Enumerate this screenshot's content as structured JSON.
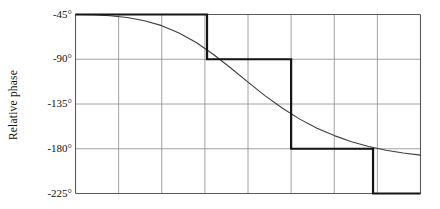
{
  "chart_data": {
    "type": "line",
    "title": "",
    "xlabel": "",
    "ylabel": "Relative phase",
    "ytick_labels": [
      "-45°",
      "-90°",
      "-135°",
      "-180°",
      "-225°"
    ],
    "ytick_values": [
      -45,
      -90,
      -135,
      -180,
      -225
    ],
    "ylim": [
      -225,
      -45
    ],
    "xlim": [
      0,
      8
    ],
    "xtick_labels": [],
    "grid": true,
    "legend": null,
    "series": [
      {
        "name": "smooth phase response",
        "style": "thin-curve",
        "x": [
          0.0,
          0.4,
          0.8,
          1.2,
          1.6,
          2.0,
          2.4,
          2.8,
          3.2,
          3.6,
          4.0,
          4.4,
          4.8,
          5.2,
          5.6,
          6.0,
          6.4,
          6.8,
          7.2,
          7.6,
          8.0
        ],
        "values": [
          -45.0,
          -45.3,
          -46.2,
          -48.0,
          -51.2,
          -56.2,
          -63.5,
          -73.2,
          -85.2,
          -98.8,
          -113.0,
          -126.8,
          -139.3,
          -150.2,
          -159.3,
          -166.8,
          -172.9,
          -177.7,
          -181.5,
          -184.3,
          -186.4
        ]
      },
      {
        "name": "stepwise approximation",
        "style": "thick-step",
        "step_x": [
          0.0,
          3.05,
          5.0,
          6.9,
          8.0
        ],
        "step_values": [
          -45,
          -90,
          -180,
          -225
        ]
      }
    ]
  },
  "axis": {
    "y_label_text": "Relative phase",
    "ticks": [
      {
        "label": "-45°",
        "value": -45
      },
      {
        "label": "-90°",
        "value": -90
      },
      {
        "label": "-135°",
        "value": -135
      },
      {
        "label": "-180°",
        "value": -180
      },
      {
        "label": "-225°",
        "value": -225
      }
    ]
  },
  "colors": {
    "grid": "#8a8a8a",
    "frame": "#5a5a5a",
    "curve": "#3d3d3d",
    "step": "#141414",
    "background": "#ffffff",
    "text": "#111111"
  }
}
